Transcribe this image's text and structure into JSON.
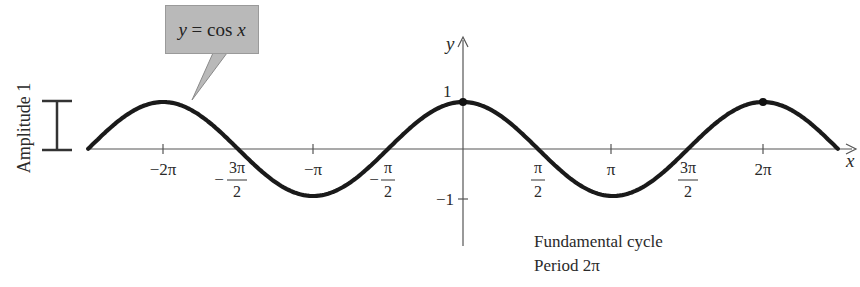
{
  "chart_data": {
    "type": "line",
    "title": "y = cos x",
    "function": "cos",
    "xlabel": "x",
    "ylabel": "y",
    "xlim": [
      -2.51327,
      2.51327
    ],
    "xlim_note": "approximately [-5π/2·0.9.. ] — curve drawn from x ≈ -2.49π to x ≈ 2.51π",
    "ylim": [
      -1,
      1
    ],
    "x_ticks": [
      {
        "value": -6.2832,
        "label": "−2π"
      },
      {
        "value": -4.7124,
        "label": "−3π/2"
      },
      {
        "value": -3.1416,
        "label": "−π"
      },
      {
        "value": -1.5708,
        "label": "−π/2"
      },
      {
        "value": 1.5708,
        "label": "π/2"
      },
      {
        "value": 3.1416,
        "label": "π"
      },
      {
        "value": 4.7124,
        "label": "3π/2"
      },
      {
        "value": 6.2832,
        "label": "2π"
      }
    ],
    "y_ticks": [
      {
        "value": 1,
        "label": "1"
      },
      {
        "value": -1,
        "label": "−1"
      }
    ],
    "x": [
      -7.85,
      -6.2832,
      -4.7124,
      -3.1416,
      -1.5708,
      0,
      1.5708,
      3.1416,
      4.7124,
      6.2832,
      7.85
    ],
    "values": [
      0,
      1,
      0,
      -1,
      0,
      1,
      0,
      -1,
      0,
      1,
      0
    ],
    "highlighted_points": [
      {
        "x": 0,
        "y": 1
      },
      {
        "x": 6.2832,
        "y": 1
      }
    ],
    "annotations": [
      {
        "text": "y = cos x",
        "type": "callout"
      },
      {
        "text": "Amplitude 1",
        "type": "bracket"
      },
      {
        "text": "Fundamental cycle",
        "type": "note"
      },
      {
        "text": "Period 2π",
        "type": "note"
      }
    ],
    "grid": false,
    "legend": null
  },
  "callout": {
    "lhs": "y",
    "eq": " = cos ",
    "rhs": "x"
  },
  "amplitude_label": "Amplitude 1",
  "axes": {
    "x_label": "x",
    "y_label": "y",
    "y_tick_top": "1",
    "y_tick_bottom": "−1"
  },
  "ticks": {
    "neg2pi": "−2π",
    "neg3pi2_num": "3π",
    "neg3pi2_den": "2",
    "neg_sign": "−",
    "negpi": "−π",
    "negpi2_num": "π",
    "negpi2_den": "2",
    "pi2_num": "π",
    "pi2_den": "2",
    "pi": "π",
    "threepi2_num": "3π",
    "threepi2_den": "2",
    "twopi": "2π"
  },
  "notes": {
    "line1": "Fundamental cycle",
    "line2": "Period 2π"
  },
  "colors": {
    "curve": "#1a1a1a",
    "axis": "#555555",
    "callout_fill": "#b9b9b9"
  }
}
